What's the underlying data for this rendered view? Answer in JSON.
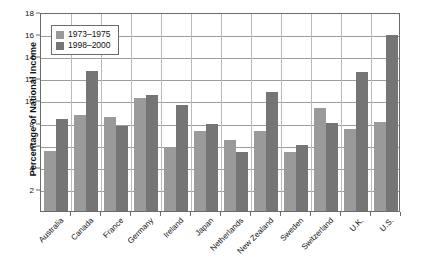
{
  "chart_data": {
    "type": "bar",
    "title": "",
    "xlabel": "",
    "ylabel": "Percentage of National Income",
    "ylim": [
      0,
      18
    ],
    "ytick_labels": [
      "0",
      "2",
      "4",
      "6",
      "8",
      "10",
      "12",
      "14",
      "16",
      "18"
    ],
    "ytick_values": [
      0,
      2,
      4,
      6,
      8,
      10,
      12,
      14,
      16,
      18
    ],
    "grid": true,
    "legend_position": "upper-left-inside",
    "categories": [
      "Australia",
      "Canada",
      "France",
      "Germany",
      "Ireland",
      "Japan",
      "Netherlands",
      "New Zealand",
      "Sweden",
      "Switzerland",
      "U.K.",
      "U.S."
    ],
    "series": [
      {
        "name": "1973–1975",
        "color": "#9a9a9a",
        "values": [
          5.4,
          8.7,
          8.5,
          10.2,
          5.8,
          7.25,
          6.4,
          7.25,
          5.35,
          9.35,
          7.45,
          8.05
        ]
      },
      {
        "name": "1998–2000",
        "color": "#757575",
        "values": [
          8.3,
          12.7,
          7.65,
          10.5,
          9.6,
          7.85,
          5.35,
          10.8,
          6.0,
          8.0,
          12.55,
          15.9
        ]
      }
    ]
  },
  "colors": {
    "series_1973": "#9a9a9a",
    "series_1998": "#757575",
    "axis": "#6b6b6b",
    "gridline": "#9d9d9d",
    "text": "#111111",
    "background": "#ffffff"
  }
}
